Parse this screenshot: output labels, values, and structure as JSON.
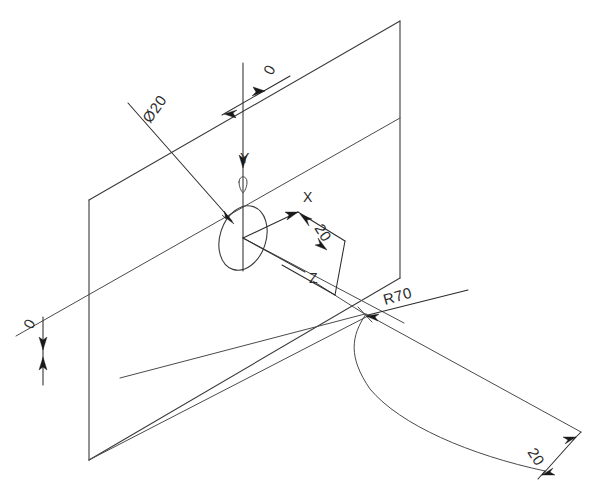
{
  "drawing": {
    "title": "Isometric engineering sketch of plane, hole and swept radius",
    "background_color": "#ffffff",
    "line_color": "#3a3a3a",
    "dimension_color": "#2a2a2a"
  },
  "labels": {
    "diameter_hole": "Ø20",
    "top_offset": "0",
    "left_offset": "0",
    "x_offset": "20",
    "radius": "R70",
    "width_bottom": "20"
  },
  "axes": {
    "x": "X",
    "y": "Y",
    "z": "Z"
  },
  "annotations": [
    {
      "name": "diameter-callout",
      "text": "Ø20",
      "x": 150,
      "y": 120,
      "rotation": -55
    },
    {
      "name": "top-offset-dim",
      "text": "0",
      "x": 274,
      "y": 72,
      "rotation": -65
    },
    {
      "name": "left-offset-dim",
      "text": "0",
      "x": 33,
      "y": 327,
      "rotation": -65
    },
    {
      "name": "x-offset-dim",
      "text": "20",
      "x": 316,
      "y": 232,
      "rotation": 60
    },
    {
      "name": "radius-callout",
      "text": "R70",
      "x": 398,
      "y": 300,
      "rotation": -20
    },
    {
      "name": "bottom-width-dim",
      "text": "20",
      "x": 528,
      "y": 447,
      "rotation": 60
    },
    {
      "name": "x-axis-label",
      "text": "X",
      "x": 307,
      "y": 203,
      "rotation": 0
    },
    {
      "name": "y-axis-label",
      "text": "Y",
      "x": 246,
      "y": 160,
      "rotation": 0
    },
    {
      "name": "z-axis-label",
      "text": "Z",
      "x": 314,
      "y": 281,
      "rotation": 0
    }
  ],
  "geometry": {
    "vertical_plane": {
      "name": "vertical-reference-plane",
      "points": "89,200 400,21 400,278 89,460"
    },
    "hole_ellipse": {
      "name": "hole-ellipse",
      "cx": 243,
      "cy": 238,
      "rx": 24,
      "ry": 33,
      "rotation": 20
    },
    "sweep_band": {
      "name": "swept-surface-band",
      "top_edge": "365,314 581,432",
      "bottom_edge": "365,314 345,345 372,393 418,424 478,452 545,471"
    }
  }
}
